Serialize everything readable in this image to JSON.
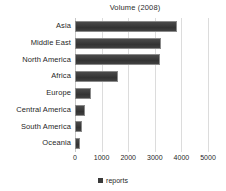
{
  "chart_data": {
    "type": "bar",
    "orientation": "horizontal",
    "title": "Volume (2008)",
    "xlabel": "",
    "ylabel": "",
    "categories": [
      "Asia",
      "Middle East",
      "North America",
      "Africa",
      "Europe",
      "Central America",
      "South America",
      "Oceania"
    ],
    "values": [
      3850,
      3250,
      3200,
      1600,
      600,
      380,
      250,
      200
    ],
    "series": [
      {
        "name": "reports",
        "values": [
          3850,
          3250,
          3200,
          1600,
          600,
          380,
          250,
          200
        ]
      }
    ],
    "xlim": [
      0,
      5000
    ],
    "xticks": [
      0,
      1000,
      2000,
      3000,
      4000,
      5000
    ],
    "xtick_labels": [
      "0",
      "1000",
      "2000",
      "3000",
      "4000",
      "5000"
    ],
    "grid": true,
    "grid_axis": "x",
    "legend": [
      "reports"
    ],
    "legend_position": "bottom",
    "colors": {
      "bar_fill": "#3a3a3a",
      "bar_border": "#8a8a8a",
      "gridline": "#dcdcdc",
      "text": "#1f1f1f",
      "background": "#ffffff"
    }
  }
}
